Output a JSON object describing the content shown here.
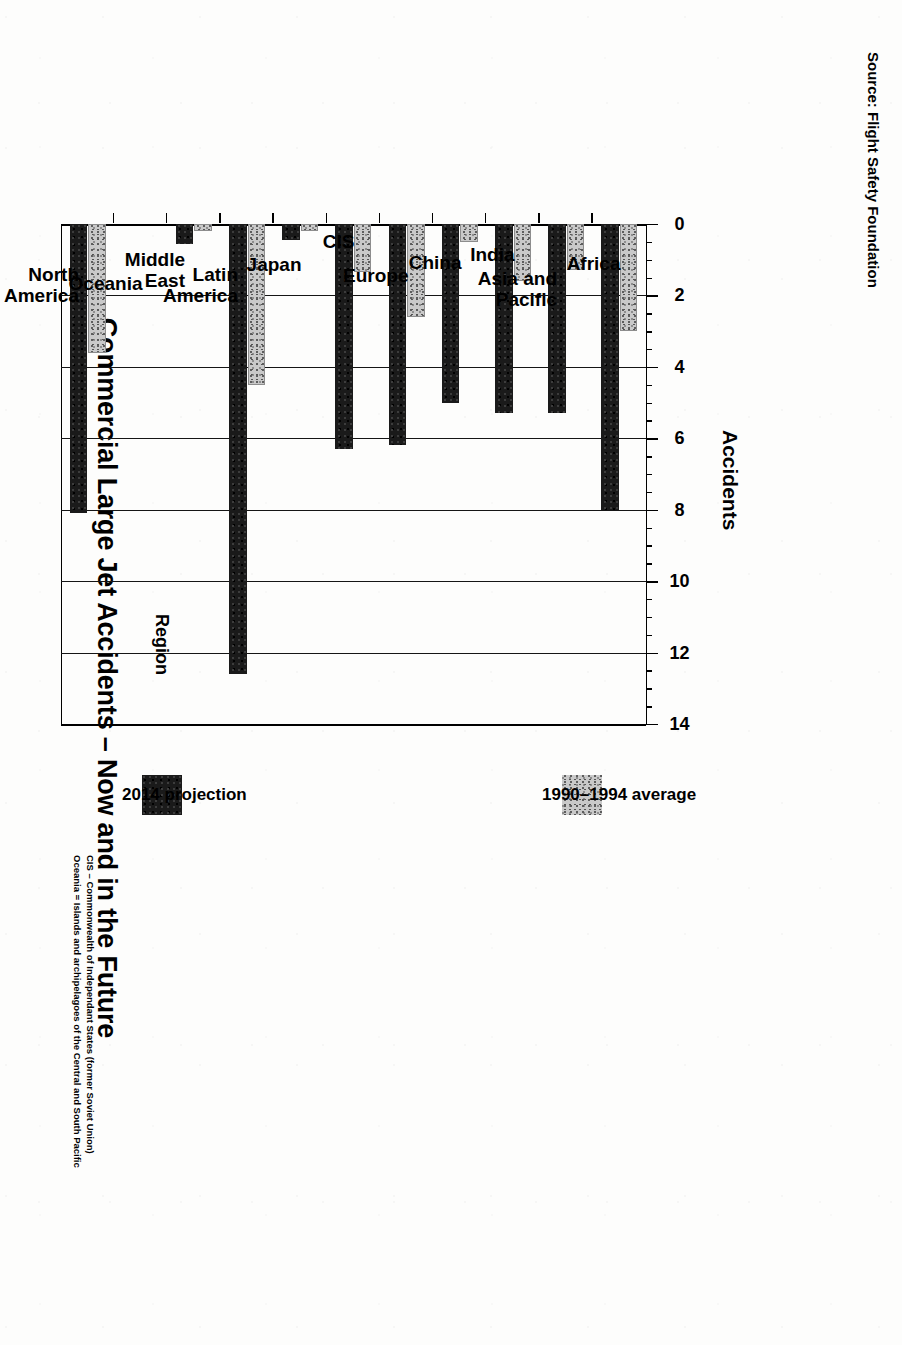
{
  "source_note": "Source: Flight Safety Foundation",
  "footnotes": [
    "CIS – Commonwealth of Independant States (former Soviet Union)",
    "Oceania = Islands and archipelagoes of the Central and South Pacific"
  ],
  "legend": {
    "position": "right",
    "items": [
      {
        "label": "1990–1994 average",
        "swatch": "light-stipple",
        "color": "#c9c9c9"
      },
      {
        "label": "2014 projection",
        "swatch": "solid-black",
        "color": "#1a1a1a"
      }
    ]
  },
  "chart_data": {
    "type": "bar",
    "orientation": "horizontal",
    "title": "Commercial Large Jet Accidents – Now and in the Future",
    "xlabel": "Accidents",
    "ylabel": "Region",
    "xlim": [
      0,
      14
    ],
    "xticks": [
      0,
      2,
      4,
      6,
      8,
      10,
      12,
      14
    ],
    "xticklabels": [
      "0",
      "2",
      "4",
      "6",
      "8",
      "10",
      "12",
      "14"
    ],
    "minor_tick_interval": 0.5,
    "grid": "value-axis gridlines at every major tick",
    "legend_position": "right",
    "categories": [
      "Africa",
      "Asia and Pacific",
      "India",
      "China",
      "Europe",
      "CIS",
      "Japan",
      "Latin America",
      "Middle East",
      "Oceania",
      "North America"
    ],
    "category_lines": [
      [
        "Africa"
      ],
      [
        "Asia and",
        "Pacific"
      ],
      [
        "India"
      ],
      [
        "China"
      ],
      [
        "Europe"
      ],
      [
        "CIS"
      ],
      [
        "Japan"
      ],
      [
        "Latin",
        "America"
      ],
      [
        "Middle",
        "East"
      ],
      [
        "Oceania"
      ],
      [
        "North",
        "America"
      ]
    ],
    "series": [
      {
        "name": "1990–1994 average",
        "values": [
          3.0,
          1.3,
          1.6,
          0.5,
          2.6,
          1.35,
          0.2,
          4.5,
          0.2,
          0.0,
          3.6
        ]
      },
      {
        "name": "2014 projection",
        "values": [
          8.0,
          5.3,
          5.3,
          5.0,
          6.2,
          6.3,
          0.45,
          12.6,
          0.55,
          0.0,
          8.1
        ]
      }
    ]
  }
}
